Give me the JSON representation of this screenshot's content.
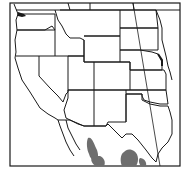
{
  "map": {
    "type": "range-map",
    "region": "Western United States and northern Mexico",
    "colors": {
      "background": "#ffffff",
      "border": "#1a1a1a",
      "range_fill": "#6e6e6e",
      "water": "#1a1a1a"
    },
    "range_areas": [
      {
        "label": "range-west",
        "description": "Sierra Madre Occidental region, Sonora/Chihuahua"
      },
      {
        "label": "range-east",
        "description": "Northern Coahuila / Nuevo Leon region"
      },
      {
        "label": "range-east-small",
        "description": "Small area near Rio Grande"
      }
    ]
  }
}
